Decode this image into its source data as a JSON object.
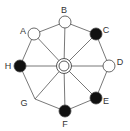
{
  "diagram": {
    "type": "wheel-graph",
    "center": {
      "x": 64,
      "y": 66,
      "style": "double-ring"
    },
    "nodes": [
      {
        "id": "A",
        "label": "A",
        "x": 34,
        "y": 34,
        "fill": "white",
        "lx": 23,
        "ly": 34
      },
      {
        "id": "B",
        "label": "B",
        "x": 65,
        "y": 22,
        "fill": "white",
        "lx": 64,
        "ly": 13
      },
      {
        "id": "C",
        "label": "C",
        "x": 96,
        "y": 34,
        "fill": "black",
        "lx": 106,
        "ly": 33
      },
      {
        "id": "D",
        "label": "D",
        "x": 109,
        "y": 66,
        "fill": "white",
        "lx": 120,
        "ly": 65
      },
      {
        "id": "E",
        "label": "E",
        "x": 96,
        "y": 98,
        "fill": "black",
        "lx": 106,
        "ly": 104
      },
      {
        "id": "F",
        "label": "F",
        "x": 65,
        "y": 111,
        "fill": "black",
        "lx": 65,
        "ly": 127
      },
      {
        "id": "G",
        "label": "G",
        "x": 35,
        "y": 99,
        "fill": "none",
        "lx": 24,
        "ly": 106
      },
      {
        "id": "H",
        "label": "H",
        "x": 20,
        "y": 66,
        "fill": "black",
        "lx": 8,
        "ly": 69
      }
    ],
    "ring_order": [
      "A",
      "B",
      "C",
      "D",
      "E",
      "F",
      "G",
      "H"
    ],
    "colors": {
      "line": "#555555",
      "black_node": "#111111",
      "white_node": "#ffffff",
      "stroke": "#444444"
    }
  }
}
